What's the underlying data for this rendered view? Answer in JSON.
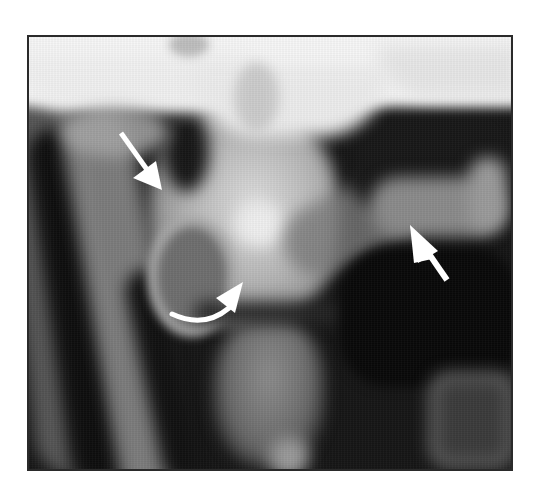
{
  "image": {
    "type": "radiograph",
    "description": "Grayscale X-ray image with three white arrow annotations inside a thin dark frame",
    "frame": {
      "x": 27,
      "y": 35,
      "width": 484,
      "height": 434,
      "border_color": "#2a2a2a"
    },
    "background_color": "#ffffff",
    "annotations": [
      {
        "id": "straight-arrow-upper-left",
        "kind": "straight-arrow",
        "direction": "down-right",
        "tail": [
          119,
          131
        ],
        "tip": [
          160,
          188
        ],
        "color": "#ffffff"
      },
      {
        "id": "curved-arrow-center",
        "kind": "curved-arrow",
        "direction": "right-up",
        "tail": [
          170,
          313
        ],
        "tip": [
          241,
          292
        ],
        "color": "#ffffff"
      },
      {
        "id": "straight-arrow-right",
        "kind": "straight-arrow",
        "direction": "up-left",
        "tail": [
          445,
          277
        ],
        "tip": [
          408,
          224
        ],
        "color": "#ffffff"
      }
    ]
  }
}
